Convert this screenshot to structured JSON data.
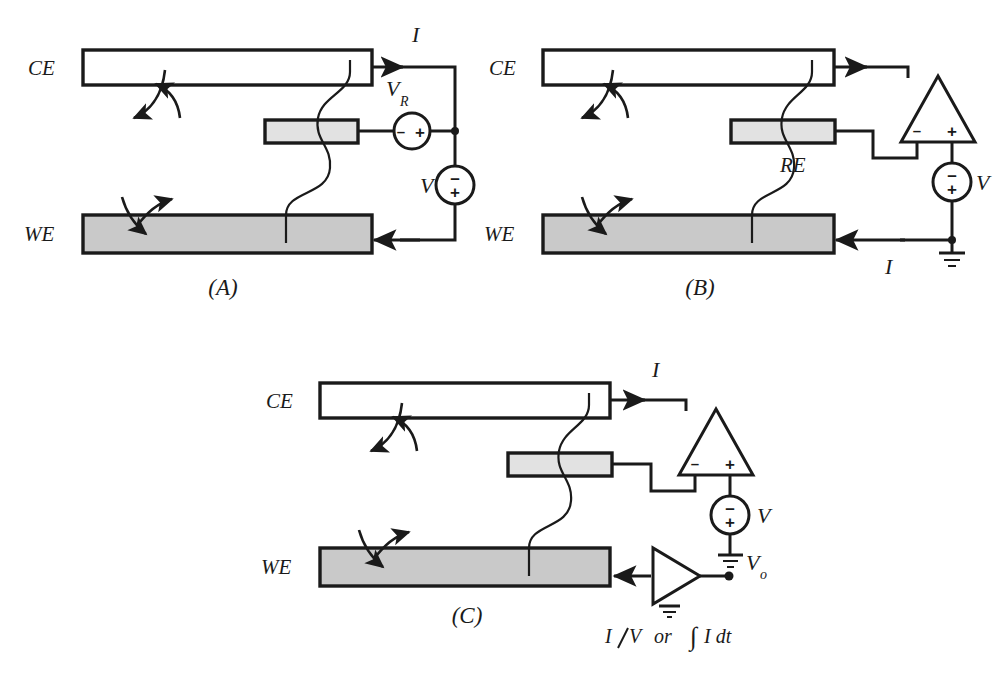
{
  "figure": {
    "background_color": "#ffffff",
    "ink_color": "#1a1a1a",
    "we_fill": "#c9c9c9",
    "re_fill": "#e2e2e2",
    "ce_fill": "#ffffff"
  },
  "panels": [
    {
      "id": "A",
      "caption": "(A)",
      "electrodes": {
        "ce_label": "CE",
        "we_label": "WE",
        "re_label": ""
      },
      "labels": {
        "current": "I",
        "voltage_source": "V",
        "reference_voltage": "V",
        "reference_voltage_sub": "R"
      },
      "source_polarity": {
        "vr_minus": "–",
        "vr_plus": "+",
        "v_minus": "–",
        "v_plus": "+"
      }
    },
    {
      "id": "B",
      "caption": "(B)",
      "electrodes": {
        "ce_label": "CE",
        "we_label": "WE",
        "re_label": "RE"
      },
      "labels": {
        "current": "I",
        "voltage_source": "V"
      },
      "opamp_terminals": {
        "inverting": "–",
        "noninverting": "+"
      },
      "source_polarity": {
        "v_minus": "–",
        "v_plus": "+"
      }
    },
    {
      "id": "C",
      "caption": "(C)",
      "electrodes": {
        "ce_label": "CE",
        "we_label": "WE",
        "re_label": ""
      },
      "labels": {
        "current": "I",
        "voltage_source": "V",
        "output_voltage": "V",
        "output_voltage_sub": "o"
      },
      "opamp_terminals": {
        "inverting": "–",
        "noninverting": "+"
      },
      "source_polarity": {
        "v_minus": "–",
        "v_plus": "+"
      },
      "function_caption": {
        "numerator": "I",
        "denominator": "V",
        "conjunction": "or",
        "integral": "∫",
        "integrand": "I dt",
        "full_text": "I/V  or  ∫I dt"
      }
    }
  ]
}
